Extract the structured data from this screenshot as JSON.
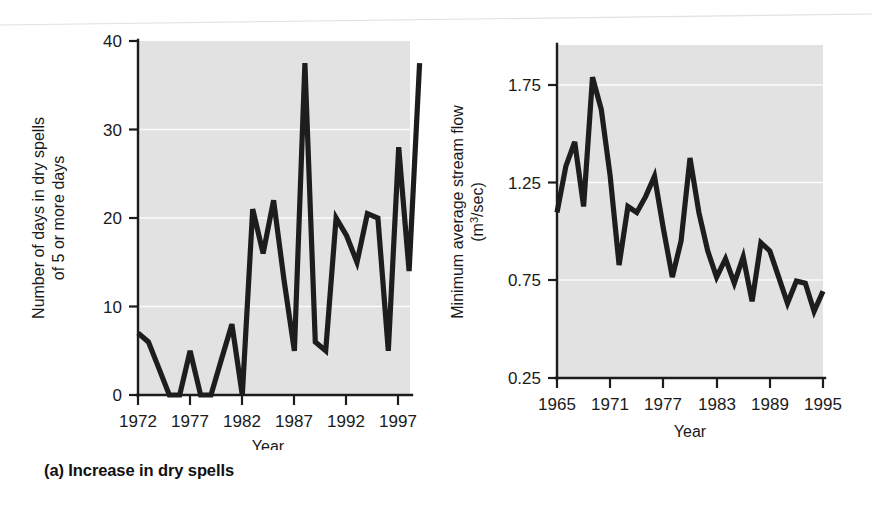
{
  "figure": {
    "background": "#ffffff",
    "plot_background": "#e2e2e2",
    "line_color": "#1d1d1d",
    "grid_color": "#fbfbfb"
  },
  "panels": [
    {
      "id": "a",
      "caption": "(a) Increase in dry spells"
    },
    {
      "id": "b",
      "caption": "(b) Decrease in stream flow"
    }
  ],
  "chart_data": [
    {
      "type": "line",
      "title": "(a) Increase in dry spells",
      "xlabel": "Year",
      "ylabel": "Number of days in dry spells of 5 or more days",
      "ylabel_line1": "Number of days in dry spells",
      "ylabel_line2": "of 5 or more days",
      "xlim": [
        1971,
        1999
      ],
      "ylim": [
        0,
        40
      ],
      "yticks": [
        0,
        10,
        20,
        30,
        40
      ],
      "ytick_labels": [
        "0",
        "10",
        "20",
        "30",
        "40"
      ],
      "xticks": [
        1972,
        1977,
        1982,
        1987,
        1992,
        1997
      ],
      "xtick_labels": [
        "1972",
        "1977",
        "1982",
        "1987",
        "1992",
        "1997"
      ],
      "grid": "horizontal-white",
      "legend": "none",
      "x": [
        1971,
        1972,
        1973,
        1974,
        1975,
        1976,
        1977,
        1978,
        1979,
        1980,
        1981,
        1982,
        1983,
        1984,
        1985,
        1986,
        1987,
        1988,
        1989,
        1990,
        1991,
        1992,
        1993,
        1994,
        1995,
        1996,
        1997,
        1998
      ],
      "values": [
        7,
        6,
        3,
        0,
        0,
        5,
        0,
        0,
        4,
        8,
        0,
        21,
        16,
        22,
        13,
        5,
        37.5,
        6,
        5,
        20,
        18,
        15,
        20.5,
        20,
        5,
        28,
        14,
        37.5
      ]
    },
    {
      "type": "line",
      "title": "(b) Decrease in stream flow",
      "xlabel": "Year",
      "ylabel": "Minimum average stream flow (m3/sec)",
      "ylabel_line1": "Minimum average stream flow",
      "ylabel_line2": "(m3/sec)",
      "ylabel_unit_base": "(m",
      "ylabel_unit_sup": "3",
      "ylabel_unit_tail": "/sec)",
      "xlim": [
        1965,
        1995
      ],
      "ylim": [
        0.25,
        1.9
      ],
      "yticks": [
        0.25,
        0.75,
        1.25,
        1.75
      ],
      "ytick_labels": [
        "0.25",
        "0.75",
        "1.25",
        "1.75"
      ],
      "xticks": [
        1965,
        1971,
        1977,
        1983,
        1989,
        1995
      ],
      "xtick_labels": [
        "1965",
        "1971",
        "1977",
        "1983",
        "1989",
        "1995"
      ],
      "grid": "horizontal-white",
      "legend": "none",
      "x": [
        1965,
        1966,
        1967,
        1968,
        1969,
        1970,
        1971,
        1972,
        1973,
        1974,
        1975,
        1976,
        1977,
        1978,
        1979,
        1980,
        1981,
        1982,
        1983,
        1984,
        1985,
        1986,
        1987,
        1988,
        1989,
        1990,
        1991,
        1992,
        1993,
        1994,
        1995
      ],
      "values": [
        1.07,
        1.3,
        1.42,
        1.1,
        1.74,
        1.58,
        1.25,
        0.81,
        1.1,
        1.07,
        1.15,
        1.25,
        0.99,
        0.75,
        0.93,
        1.34,
        1.07,
        0.88,
        0.75,
        0.84,
        0.72,
        0.85,
        0.63,
        0.92,
        0.88,
        0.75,
        0.62,
        0.73,
        0.72,
        0.58,
        0.68
      ]
    }
  ]
}
